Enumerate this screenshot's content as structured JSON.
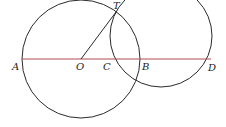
{
  "diagram": {
    "colors": {
      "circle": "#2a2a2a",
      "segment_OT": "#2a2a2a",
      "line_AD": "#b04a55",
      "label": "#222222"
    },
    "big_circle": {
      "center_label": "O",
      "cx": 81,
      "cy": 59,
      "r": 59
    },
    "small_circle": {
      "cx": 161,
      "cy": 36,
      "r": 51
    },
    "points": [
      {
        "name": "A",
        "x": 22,
        "y": 59
      },
      {
        "name": "O",
        "x": 81,
        "y": 59
      },
      {
        "name": "C",
        "x": 110,
        "y": 59
      },
      {
        "name": "B",
        "x": 140,
        "y": 59
      },
      {
        "name": "D",
        "x": 211,
        "y": 59
      },
      {
        "name": "T",
        "x": 116,
        "y": 12
      }
    ],
    "labels": {
      "A": "A",
      "O": "O",
      "C": "C",
      "B": "B",
      "D": "D",
      "T": "T"
    }
  }
}
